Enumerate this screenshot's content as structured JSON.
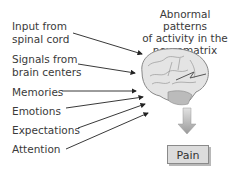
{
  "diagram": {
    "title": "Abnormal patterns of activity in the neuromatrix",
    "title_lines": [
      "Abnormal patterns",
      "of activity in the",
      "neuromatrix"
    ],
    "inputs": [
      {
        "lines": [
          "Input from",
          "spinal cord"
        ]
      },
      {
        "lines": [
          "Signals from",
          "brain centers"
        ]
      },
      {
        "lines": [
          "Memories"
        ]
      },
      {
        "lines": [
          "Emotions"
        ]
      },
      {
        "lines": [
          "Expectations"
        ]
      },
      {
        "lines": [
          "Attention"
        ]
      }
    ],
    "center_icon": "brain-icon",
    "output_arrow_icon": "down-arrow-icon",
    "output": "Pain",
    "colors": {
      "text": "#3a3a3a",
      "arrow": "#222222",
      "brain": "#d8d8d8",
      "pain_box": "#dcdcdc"
    }
  }
}
